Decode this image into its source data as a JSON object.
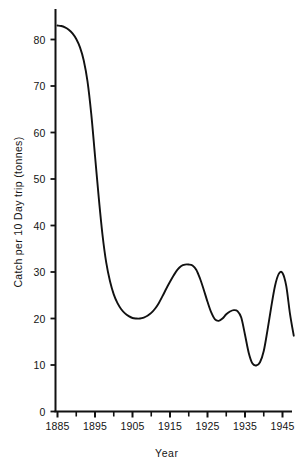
{
  "chart_data": {
    "type": "line",
    "title": "",
    "xlabel": "Year",
    "ylabel": "Catch per 10 Day trip (tonnes)",
    "xlim": [
      1883,
      1949
    ],
    "ylim": [
      0,
      85
    ],
    "grid": false,
    "legend": "none",
    "x_ticks_major": [
      1885,
      1895,
      1905,
      1915,
      1925,
      1935,
      1945
    ],
    "x_tick_labels": [
      "1885",
      "1895",
      "1905",
      "1915",
      "1925",
      "1935",
      "1945"
    ],
    "x_ticks_minor": [
      1890,
      1900,
      1910,
      1920,
      1930,
      1940,
      1948
    ],
    "y_ticks": [
      0,
      10,
      20,
      30,
      40,
      50,
      60,
      70,
      80
    ],
    "y_tick_labels": [
      "0",
      "10",
      "20",
      "30",
      "40",
      "50",
      "60",
      "70",
      "80"
    ],
    "line_color": "#111111",
    "series": [
      {
        "name": "Catch per 10 Day trip",
        "x": [
          1885,
          1886,
          1887,
          1888,
          1889,
          1890,
          1891,
          1892,
          1893,
          1894,
          1895,
          1896,
          1897,
          1898,
          1899,
          1900,
          1901,
          1902,
          1903,
          1904,
          1905,
          1906,
          1907,
          1908,
          1909,
          1910,
          1911,
          1912,
          1913,
          1914,
          1915,
          1916,
          1917,
          1918,
          1919,
          1920,
          1921,
          1922,
          1923,
          1924,
          1925,
          1926,
          1927,
          1928,
          1929,
          1930,
          1931,
          1932,
          1933,
          1934,
          1935,
          1936,
          1937,
          1938,
          1939,
          1940,
          1941,
          1942,
          1943,
          1944,
          1945,
          1946,
          1947,
          1948
        ],
        "y": [
          83.0,
          82.9,
          82.6,
          82.1,
          81.3,
          80.1,
          78.3,
          75.5,
          71.0,
          64.0,
          55.0,
          46.0,
          38.0,
          32.0,
          28.0,
          25.2,
          23.3,
          22.0,
          21.1,
          20.5,
          20.1,
          20.0,
          20.0,
          20.2,
          20.6,
          21.2,
          22.1,
          23.3,
          24.8,
          26.4,
          27.9,
          29.3,
          30.5,
          31.3,
          31.6,
          31.6,
          31.4,
          30.5,
          28.6,
          26.2,
          23.6,
          21.3,
          19.8,
          19.5,
          20.0,
          20.9,
          21.5,
          21.8,
          21.6,
          20.2,
          16.5,
          12.6,
          10.3,
          9.9,
          10.6,
          13.0,
          17.5,
          22.5,
          27.0,
          29.6,
          29.8,
          27.0,
          21.0,
          16.3
        ]
      }
    ]
  },
  "axis": {
    "y_title": "Catch per 10 Day trip (tonnes)",
    "x_title": "Year"
  }
}
